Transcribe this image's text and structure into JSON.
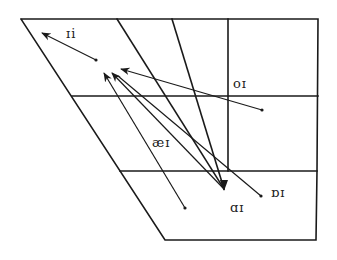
{
  "diagram": {
    "type": "vowel-trapezoid-diphthong-chart",
    "colors": {
      "line": "#1a1a1a",
      "background": "#ffffff"
    },
    "labels": [
      {
        "id": "ii",
        "text": "ɪi",
        "x": 66,
        "y": 38
      },
      {
        "id": "oi",
        "text": "oɪ",
        "x": 233,
        "y": 88
      },
      {
        "id": "aei",
        "text": "æɪ",
        "x": 152,
        "y": 147
      },
      {
        "id": "oi-open",
        "text": "ɒɪ",
        "x": 271,
        "y": 197
      },
      {
        "id": "ai",
        "text": "ɑɪ",
        "x": 230,
        "y": 212
      }
    ],
    "arrows": [
      {
        "id": "ii",
        "from": [
          96,
          60
        ],
        "to": [
          42,
          33
        ]
      },
      {
        "id": "aei",
        "from": [
          185,
          208
        ],
        "to": [
          104,
          73
        ]
      },
      {
        "id": "ai",
        "from": [
          224,
          189
        ],
        "to": [
          112,
          73
        ]
      },
      {
        "id": "oi-open",
        "from": [
          261,
          196
        ],
        "to": [
          112,
          73
        ]
      },
      {
        "id": "oi",
        "from": [
          262,
          110
        ],
        "to": [
          121,
          69
        ]
      }
    ]
  }
}
